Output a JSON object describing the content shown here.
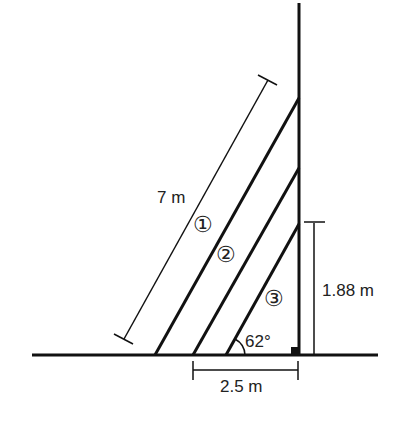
{
  "diagram": {
    "labels": {
      "ladder_length": "7 m",
      "height": "1.88 m",
      "base_distance": "2.5 m",
      "angle": "62°",
      "ladder1": "①",
      "ladder2": "②",
      "ladder3": "③"
    },
    "colors": {
      "line": "#111111",
      "background": "#ffffff"
    }
  }
}
